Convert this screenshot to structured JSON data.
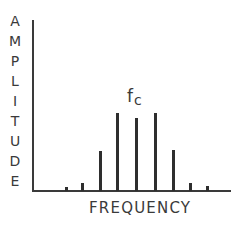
{
  "figure": {
    "y_axis_label": "AMPLITUDE",
    "y_axis_letters": [
      "A",
      "M",
      "P",
      "L",
      "I",
      "T",
      "U",
      "D",
      "E"
    ],
    "x_axis_label": "FREQUENCY",
    "carrier_label_main": "f",
    "carrier_label_sub": "c",
    "colors": {
      "ink": "#2e2e2e",
      "background": "#ffffff"
    }
  },
  "chart_data": {
    "type": "bar",
    "title": "",
    "xlabel": "FREQUENCY",
    "ylabel": "AMPLITUDE",
    "annotations": [
      {
        "text": "fc",
        "at_index": 4
      }
    ],
    "categories": [
      "-4",
      "-3",
      "-2",
      "-1",
      "fc",
      "+1",
      "+2",
      "+3",
      "+4"
    ],
    "values": [
      4,
      8,
      40,
      78,
      73,
      78,
      41,
      8,
      5
    ],
    "ylim": [
      0,
      100
    ],
    "grid": false,
    "legend": "none",
    "bars_px": [
      {
        "x": 65,
        "top": 187
      },
      {
        "x": 81,
        "top": 183
      },
      {
        "x": 99,
        "top": 151
      },
      {
        "x": 116,
        "top": 113
      },
      {
        "x": 135,
        "top": 118
      },
      {
        "x": 154,
        "top": 113
      },
      {
        "x": 172,
        "top": 150
      },
      {
        "x": 189,
        "top": 183
      },
      {
        "x": 206,
        "top": 186
      }
    ]
  }
}
